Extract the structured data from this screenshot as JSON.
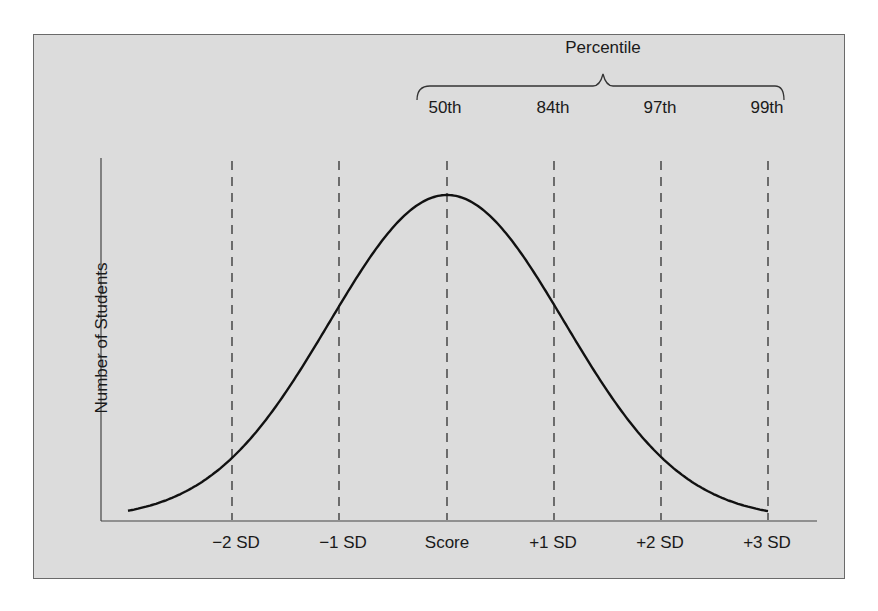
{
  "chart": {
    "ylabel": "Number of Students",
    "bracket_title": "Percentile",
    "percentiles": [
      "50th",
      "84th",
      "97th",
      "99th"
    ],
    "xticks": [
      "−2 SD",
      "−1 SD",
      "Score",
      "+1 SD",
      "+2 SD",
      "+3 SD"
    ]
  },
  "colors": {
    "panel": "#dcdcdc",
    "border": "#6a6a6a",
    "curve": "#111111"
  },
  "chart_data": {
    "type": "line",
    "title": "",
    "xlabel": "",
    "ylabel": "Number of Students",
    "categories": [
      "-2 SD",
      "-1 SD",
      "Score",
      "+1 SD",
      "+2 SD",
      "+3 SD"
    ],
    "series": [
      {
        "name": "Normal distribution",
        "x": [
          -3,
          -2,
          -1,
          0,
          1,
          2,
          3
        ],
        "values": [
          0.0,
          0.135,
          0.607,
          1.0,
          0.607,
          0.135,
          0.0
        ]
      }
    ],
    "annotations": {
      "bracket_label": "Percentile",
      "percentile_marks": [
        {
          "x": "Score",
          "label": "50th"
        },
        {
          "x": "+1 SD",
          "label": "84th"
        },
        {
          "x": "+2 SD",
          "label": "97th"
        },
        {
          "x": "+3 SD",
          "label": "99th"
        }
      ]
    },
    "grid": false,
    "reference_lines": "dashed vertical lines at each SD mark"
  }
}
